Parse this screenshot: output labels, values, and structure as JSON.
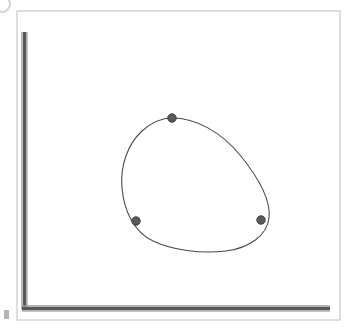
{
  "figure": {
    "canvas": {
      "width": 357,
      "height": 330,
      "background_color": "#ffffff"
    },
    "frame": {
      "name": "outer-border",
      "x": 17,
      "y": 11,
      "width": 323,
      "height": 309,
      "stroke_color": "#c9c9c9",
      "stroke_width": 1.2,
      "fill": "none"
    },
    "axes": {
      "style": "L-shaped beveled rules",
      "stroke_color": "#585858",
      "highlight_color": "#9a9a9a",
      "shadow_color": "#c2c2c2",
      "thickness": 5,
      "y_axis": {
        "name": "y-axis",
        "x": 24,
        "y_top": 32,
        "y_bottom": 310,
        "orientation": "vertical"
      },
      "x_axis": {
        "name": "x-axis",
        "y": 308,
        "x_left": 22,
        "x_right": 330,
        "orientation": "horizontal"
      }
    },
    "curve": {
      "name": "closed-curve",
      "type": "closed-loop",
      "description": "egg-shaped closed curve, narrower at the upper-left and bulging lower-right",
      "stroke_color": "#4a4a4a",
      "stroke_width": 1.1,
      "fill": "none",
      "bounds": {
        "x_min": 122,
        "x_max": 271,
        "y_min": 117,
        "y_max": 251
      },
      "path": "M 172 118 C 196 118 221 132 240 155 C 258 177 271 200 269 218 C 267 235 250 248 226 251 C 200 254 172 250 153 241 C 134 232 124 211 122 188 C 120 165 128 144 142 131 C 152 122 161 118 172 118 Z"
    },
    "points": [
      {
        "name": "point-top",
        "label": "top marked point",
        "x": 172,
        "y": 118,
        "radius": 4.2,
        "fill_color": "#5a5a5a",
        "stroke_color": "#3c3c3c"
      },
      {
        "name": "point-left",
        "label": "left marked point",
        "x": 136,
        "y": 221,
        "radius": 4.2,
        "fill_color": "#5a5a5a",
        "stroke_color": "#3c3c3c"
      },
      {
        "name": "point-right",
        "label": "right marked point",
        "x": 261,
        "y": 220,
        "radius": 4.2,
        "fill_color": "#5a5a5a",
        "stroke_color": "#3c3c3c"
      }
    ],
    "artifacts": [
      {
        "name": "corner-arc-artifact",
        "description": "faint partial circle arc clipped at the top-left page corner",
        "cx": 2,
        "cy": 4,
        "r": 8,
        "stroke_color": "#d5d5d5",
        "stroke_width": 2.2
      },
      {
        "name": "left-edge-smudge-artifact",
        "description": "small gray rectangular scan smudge on the left margin near the bottom",
        "x": 4,
        "y": 310,
        "width": 5,
        "height": 9,
        "fill_color": "#b4b4b4"
      }
    ]
  },
  "chart_data": {
    "type": "line",
    "title": "",
    "xlabel": "",
    "ylabel": "",
    "grid": false,
    "legend": "none",
    "series": [
      {
        "name": "closed-curve",
        "closed": true,
        "x": [
          172,
          196,
          221,
          240,
          258,
          271,
          269,
          267,
          250,
          226,
          200,
          172,
          153,
          134,
          124,
          122,
          120,
          128,
          142,
          152,
          161,
          172
        ],
        "y": [
          118,
          118,
          132,
          155,
          177,
          200,
          218,
          235,
          248,
          251,
          254,
          250,
          241,
          232,
          211,
          188,
          165,
          144,
          131,
          122,
          118,
          118
        ]
      },
      {
        "name": "marked-points",
        "marker": "filled-circle",
        "x": [
          172,
          136,
          261
        ],
        "y": [
          118,
          221,
          220
        ]
      }
    ],
    "axis_origin": [
      24,
      308
    ],
    "xlim": [
      24,
      330
    ],
    "ylim": [
      32,
      308
    ]
  }
}
